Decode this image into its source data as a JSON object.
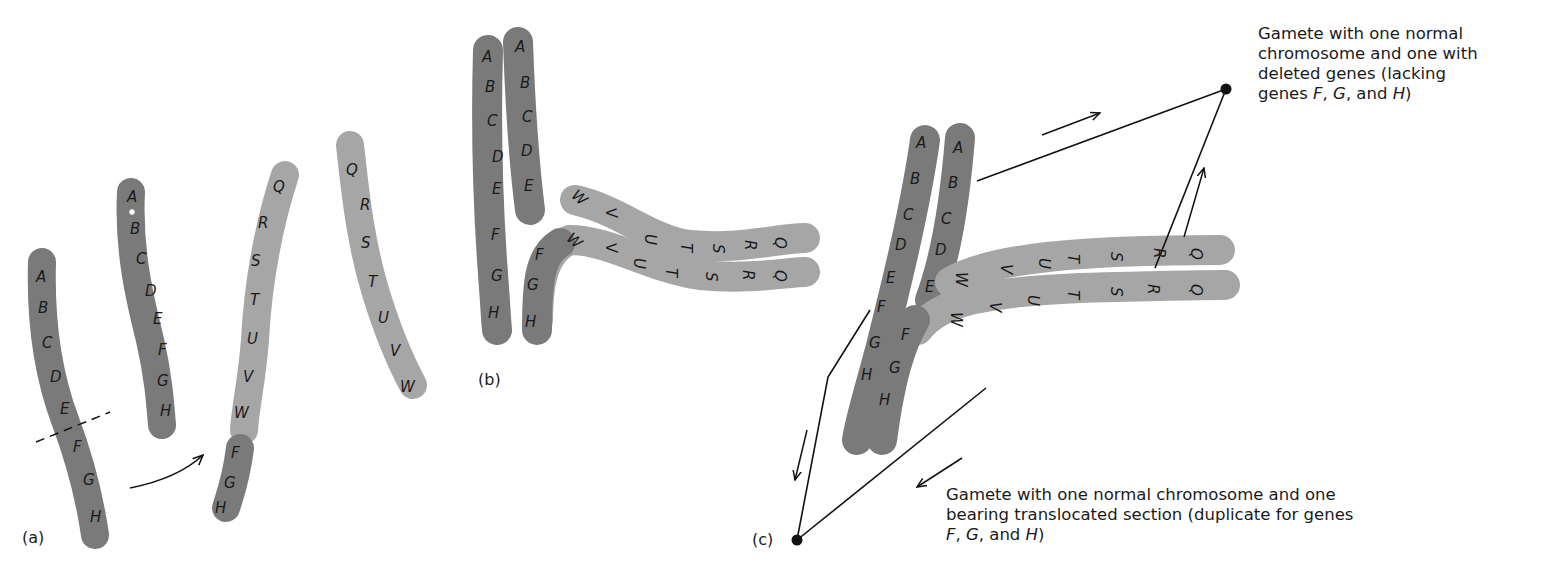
{
  "colors": {
    "dark_chromosome": "#7a7a7a",
    "light_chromosome": "#a6a6a6",
    "line": "#111111",
    "background": "#ffffff"
  },
  "panels": {
    "a": {
      "label": "(a)",
      "chromosomes": [
        {
          "genes": [
            "A",
            "B",
            "C",
            "D",
            "E",
            "F",
            "G",
            "H"
          ],
          "shade": "dark",
          "note": "break between E and F (dashed line)"
        },
        {
          "genes": [
            "A",
            "B",
            "C",
            "D",
            "E",
            "F",
            "G",
            "H"
          ],
          "shade": "dark"
        },
        {
          "genes": [
            "Q",
            "R",
            "S",
            "T",
            "U",
            "V",
            "W"
          ],
          "shade": "light",
          "attached": [
            "F",
            "G",
            "H"
          ]
        },
        {
          "genes": [
            "Q",
            "R",
            "S",
            "T",
            "U",
            "V",
            "W"
          ],
          "shade": "light"
        }
      ]
    },
    "b": {
      "label": "(b)",
      "chromosomes": [
        {
          "genes": [
            "A",
            "B",
            "C",
            "D",
            "E",
            "F",
            "G",
            "H"
          ]
        },
        {
          "genes": [
            "A",
            "B",
            "C",
            "D",
            "E"
          ]
        },
        {
          "genes": [
            "W",
            "V",
            "U",
            "T",
            "S",
            "R",
            "Q"
          ]
        },
        {
          "genes": [
            "F",
            "G",
            "H",
            "W",
            "V",
            "U",
            "T",
            "S",
            "R",
            "Q"
          ]
        }
      ]
    },
    "c": {
      "label": "(c)",
      "chromosomes": [
        {
          "genes": [
            "A",
            "B",
            "C",
            "D",
            "E",
            "F",
            "G",
            "H"
          ]
        },
        {
          "genes": [
            "A",
            "B",
            "C",
            "D",
            "E"
          ]
        },
        {
          "genes": [
            "W",
            "V",
            "U",
            "T",
            "S",
            "R",
            "Q"
          ]
        },
        {
          "genes": [
            "F",
            "G",
            "H",
            "W",
            "V",
            "U",
            "T",
            "S",
            "R",
            "Q"
          ]
        }
      ],
      "caption_top": {
        "line1": "Gamete with one normal",
        "line2": "chromosome and one with",
        "line3": "deleted genes (lacking",
        "line4_pre": "genes ",
        "line4_f": "F",
        "line4_sep1": ", ",
        "line4_g": "G",
        "line4_sep2": ", and ",
        "line4_h": "H",
        "line4_post": ")"
      },
      "caption_bottom": {
        "line1": "Gamete with one normal chromosome and one",
        "line2": "bearing translocated section (duplicate for genes",
        "line3_f": "F",
        "line3_sep1": ", ",
        "line3_g": "G",
        "line3_sep2": ", and ",
        "line3_h": "H",
        "line3_post": ")"
      }
    }
  }
}
